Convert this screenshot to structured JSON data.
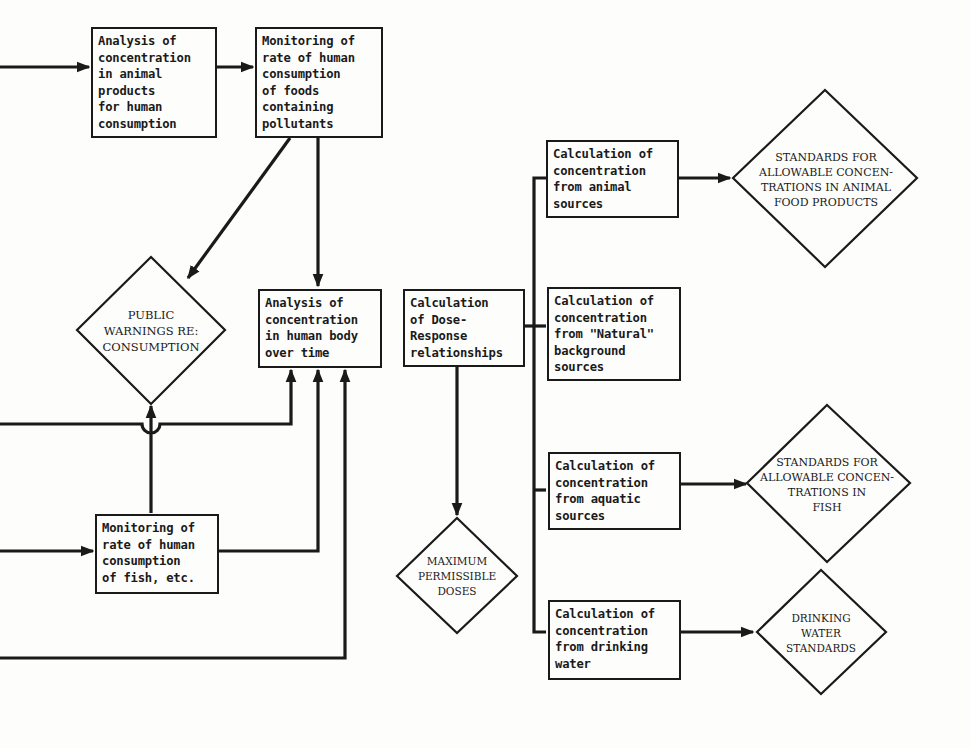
{
  "boxes": {
    "animal_products_analysis": "Analysis of\nconcentration\nin animal\nproducts\nfor human\nconsumption",
    "food_consumption_monitoring": "Monitoring of\nrate of human\nconsumption\nof foods\ncontaining\npollutants",
    "human_body_analysis": "Analysis of\nconcentration\nin human body\nover time",
    "fish_consumption_monitoring": "Monitoring of\nrate of human\nconsumption\nof fish, etc.",
    "dose_response": "Calculation\nof Dose-\nResponse\nrelationships",
    "calc_animal_sources": "Calculation of\nconcentration\nfrom animal\nsources",
    "calc_natural_sources": "Calculation of\nconcentration\nfrom \"Natural\"\nbackground\nsources",
    "calc_aquatic_sources": "Calculation of\nconcentration\nfrom aquatic\nsources",
    "calc_drinking_water": "Calculation of\nconcentration\nfrom drinking\nwater"
  },
  "diamonds": {
    "public_warnings": "PUBLIC\nWARNINGS RE:\nCONSUMPTION",
    "max_permissible_doses": "MAXIMUM\nPERMISSIBLE\nDOSES",
    "standards_animal_food": "STANDARDS FOR\nALLOWABLE CONCEN-\nTRATIONS IN ANIMAL\nFOOD PRODUCTS",
    "standards_fish": "STANDARDS FOR\nALLOWABLE CONCEN-\nTRATIONS IN\nFISH",
    "drinking_water_standards": "DRINKING\nWATER\nSTANDARDS"
  }
}
